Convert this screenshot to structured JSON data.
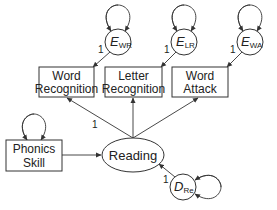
{
  "diagram": {
    "type": "path-diagram",
    "colors": {
      "stroke": "#333333",
      "text": "#222222",
      "background": "#ffffff"
    },
    "observed": [
      {
        "id": "word_recognition",
        "lines": [
          "Word",
          "Recognition"
        ]
      },
      {
        "id": "letter_recognition",
        "lines": [
          "Letter",
          "Recognition"
        ]
      },
      {
        "id": "word_attack",
        "lines": [
          "Word",
          "Attack"
        ]
      },
      {
        "id": "phonics_skill",
        "lines": [
          "Phonics",
          "Skill"
        ]
      }
    ],
    "latent": {
      "id": "reading",
      "label": "Reading"
    },
    "errors": [
      {
        "id": "e_wr",
        "main": "E",
        "sub": "WR",
        "path_label": "1"
      },
      {
        "id": "e_lr",
        "main": "E",
        "sub": "LR",
        "path_label": "1"
      },
      {
        "id": "e_wa",
        "main": "E",
        "sub": "WA",
        "path_label": "1"
      }
    ],
    "disturbance": {
      "id": "d_re",
      "main": "D",
      "sub": "Re",
      "path_label": "1"
    },
    "loading_label": "1"
  }
}
